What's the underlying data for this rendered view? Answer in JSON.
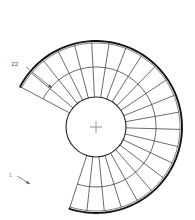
{
  "drawing": {
    "title": "Spiral Staircase Plan",
    "type": "cad-plan-view",
    "background_color": "#ffffff",
    "line_color": "#3a3a3a",
    "rail_color": "#141414",
    "center_mark_color": "#8a8a8a"
  },
  "geometry": {
    "center_x": 96,
    "center_y": 127,
    "inner_radius": 30,
    "middle_radius": 60,
    "outer_radius": 84,
    "rail_radius": 86,
    "start_angle_deg": 152,
    "sweep_deg": 260,
    "tread_count": 22
  },
  "labels": {
    "first_step": "1",
    "last_step": "22",
    "center_mark": "+"
  },
  "annotations": [
    {
      "id": "label-22",
      "text": "22",
      "x": 18,
      "y": 66,
      "leader_from_x": 26,
      "leader_from_y": 67,
      "leader_to_x": 52,
      "leader_to_y": 88
    },
    {
      "id": "label-1",
      "text": "1",
      "x": 12,
      "y": 177,
      "leader_from_x": 17,
      "leader_from_y": 176,
      "leader_to_x": 30,
      "leader_to_y": 184
    }
  ],
  "chart_data": {
    "type": "diagram",
    "tread_count": 22,
    "inner_radius": 30,
    "middle_radius": 60,
    "outer_radius": 84,
    "sweep_deg": 260,
    "labels": [
      "1",
      "22"
    ]
  }
}
